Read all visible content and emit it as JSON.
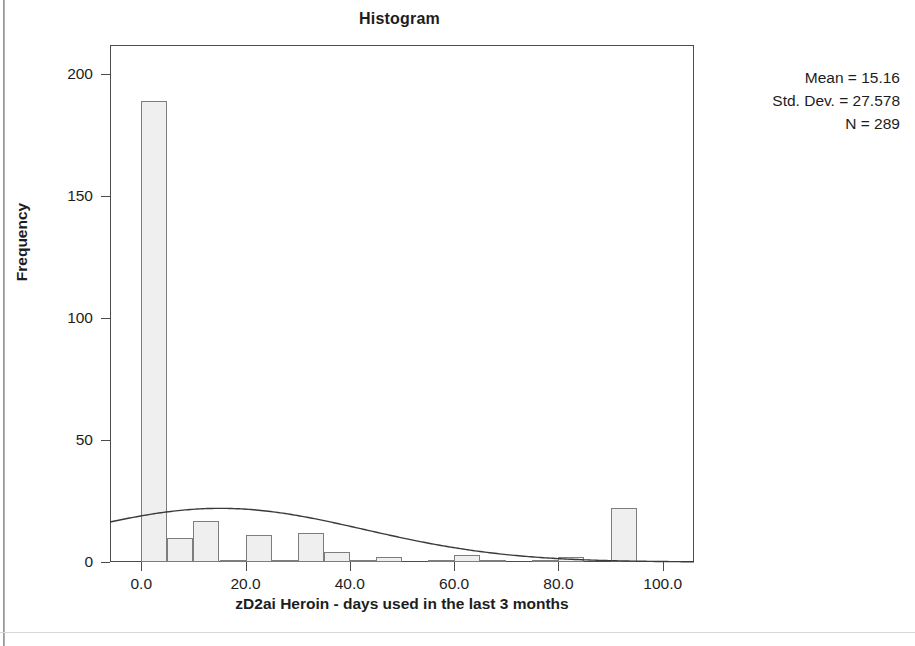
{
  "chart_data": {
    "type": "bar",
    "title": "Histogram",
    "xlabel": "zD2ai Heroin - days used in the last 3 months",
    "ylabel": "Frequency",
    "xlim": [
      -6,
      106
    ],
    "ylim": [
      0,
      212
    ],
    "grid": false,
    "legend": null,
    "bin_width": 5,
    "x_ticks": [
      "0.0",
      "20.0",
      "40.0",
      "60.0",
      "80.0",
      "100.0"
    ],
    "x_tick_values": [
      0,
      20,
      40,
      60,
      80,
      100
    ],
    "y_ticks": [
      "0",
      "50",
      "100",
      "150",
      "200"
    ],
    "y_tick_values": [
      0,
      50,
      100,
      150,
      200
    ],
    "categories": [
      "0-5",
      "5-10",
      "10-15",
      "15-20",
      "20-25",
      "25-30",
      "30-35",
      "35-40",
      "40-45",
      "45-50",
      "50-55",
      "55-60",
      "60-65",
      "65-70",
      "70-75",
      "75-80",
      "80-85",
      "85-90",
      "90-95",
      "95-100",
      "100-105"
    ],
    "bin_starts": [
      0,
      5,
      10,
      15,
      20,
      25,
      30,
      35,
      40,
      45,
      50,
      55,
      60,
      65,
      70,
      75,
      80,
      85,
      90,
      95,
      100
    ],
    "values": [
      189,
      10,
      17,
      1,
      11,
      1,
      12,
      4,
      1,
      2,
      0,
      1,
      3,
      1,
      0,
      1,
      2,
      0,
      22,
      0,
      0
    ],
    "overlay": {
      "type": "normal_curve",
      "mean": 15.16,
      "std_dev": 27.578,
      "n": 289,
      "peak_frequency": 22
    },
    "annotations": {
      "mean": "Mean = 15.16",
      "std_dev": "Std. Dev. = 27.578",
      "n": "N = 289"
    }
  },
  "colors": {
    "bar_fill": "#efefef",
    "bar_border": "#7d7d7d",
    "axis": "#4c4c4c",
    "text": "#1d1d1d",
    "curve": "#3a3a3a",
    "background": "#ffffff"
  }
}
